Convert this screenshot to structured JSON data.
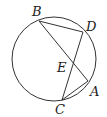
{
  "diagram": {
    "type": "circle-with-intersecting-chords",
    "circle": {
      "cx": 54,
      "cy": 59,
      "r": 42
    },
    "points": {
      "B": {
        "label": "B",
        "x": 39,
        "y": 21,
        "lx": 32,
        "ly": 16
      },
      "D": {
        "label": "D",
        "x": 83,
        "y": 32,
        "lx": 86,
        "ly": 31
      },
      "A": {
        "label": "A",
        "x": 88,
        "y": 81,
        "lx": 90,
        "ly": 96
      },
      "C": {
        "label": "C",
        "x": 62,
        "y": 100,
        "lx": 55,
        "ly": 114
      },
      "E": {
        "label": "E",
        "x": 73,
        "y": 62,
        "lx": 57,
        "ly": 72
      }
    },
    "segments": [
      [
        "B",
        "D"
      ],
      [
        "B",
        "A"
      ],
      [
        "D",
        "C"
      ],
      [
        "C",
        "A"
      ]
    ]
  }
}
